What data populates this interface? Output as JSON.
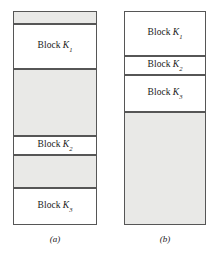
{
  "figure": {
    "type": "memory-allocation-diagram",
    "colors": {
      "free_space_fill": "#e9e9e7",
      "allocated_fill": "#ffffff",
      "border": "#565656",
      "text": "#1a1a1a",
      "background": "#ffffff"
    },
    "panels": [
      {
        "id": "a",
        "caption": "(a)",
        "segments": [
          {
            "kind": "free",
            "label": "",
            "block": "",
            "subscript": "",
            "top": 0,
            "height": 13
          },
          {
            "kind": "allocated",
            "label": "Block",
            "block": "K",
            "subscript": "1",
            "top": 13,
            "height": 45
          },
          {
            "kind": "free",
            "label": "",
            "block": "",
            "subscript": "",
            "top": 58,
            "height": 67
          },
          {
            "kind": "allocated",
            "label": "Block",
            "block": "K",
            "subscript": "2",
            "top": 125,
            "height": 19
          },
          {
            "kind": "free",
            "label": "",
            "block": "",
            "subscript": "",
            "top": 144,
            "height": 33
          },
          {
            "kind": "allocated",
            "label": "Block",
            "block": "K",
            "subscript": "3",
            "top": 177,
            "height": 37
          }
        ]
      },
      {
        "id": "b",
        "caption": "(b)",
        "segments": [
          {
            "kind": "allocated",
            "label": "Block",
            "block": "K",
            "subscript": "1",
            "top": 0,
            "height": 45
          },
          {
            "kind": "allocated",
            "label": "Block",
            "block": "K",
            "subscript": "2",
            "top": 45,
            "height": 19
          },
          {
            "kind": "allocated",
            "label": "Block",
            "block": "K",
            "subscript": "3",
            "top": 64,
            "height": 37
          },
          {
            "kind": "free",
            "label": "",
            "block": "",
            "subscript": "",
            "top": 101,
            "height": 113
          }
        ]
      }
    ]
  }
}
